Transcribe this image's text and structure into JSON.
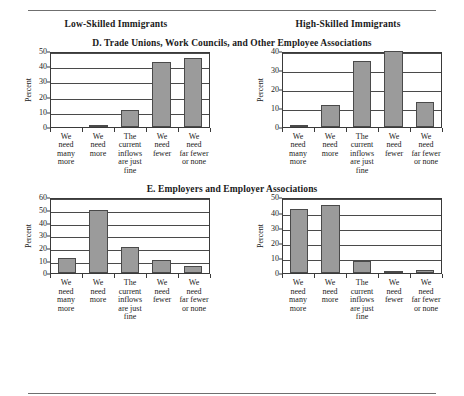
{
  "figure": {
    "column_headers": [
      "Low-Skilled Immigrants",
      "High-Skilled Immigrants"
    ],
    "panels": [
      {
        "title": "D. Trade Unions, Work Councils, and Other Employee Associations"
      },
      {
        "title": "E. Employers and Employer Associations"
      }
    ],
    "axis_label": "Percent"
  },
  "chart_data": [
    {
      "type": "bar",
      "title": "D. Trade Unions, Work Councils, and Other Employee Associations",
      "subtitle": "Low-Skilled Immigrants",
      "panel": "D",
      "column": "Low-Skilled Immigrants",
      "categories": [
        "We need many more",
        "We need more",
        "The current inflows are just fine",
        "We need fewer",
        "We need far fewer or none"
      ],
      "category_lines": [
        [
          "We",
          "need",
          "many",
          "more"
        ],
        [
          "We",
          "need",
          "more"
        ],
        [
          "The",
          "current",
          "inflows",
          "are just",
          "fine"
        ],
        [
          "We",
          "need",
          "fewer"
        ],
        [
          "We",
          "need",
          "far fewer",
          "or none"
        ]
      ],
      "values": [
        0,
        1.5,
        11,
        42.5,
        45.5
      ],
      "xlabel": "",
      "ylabel": "Percent",
      "ylim": [
        0,
        50
      ],
      "yticks": [
        0,
        10,
        20,
        30,
        40,
        50
      ],
      "grid": true,
      "legend": "none"
    },
    {
      "type": "bar",
      "title": "D. Trade Unions, Work Councils, and Other Employee Associations",
      "subtitle": "High-Skilled Immigrants",
      "panel": "D",
      "column": "High-Skilled Immigrants",
      "categories": [
        "We need many more",
        "We need more",
        "The current inflows are just fine",
        "We need fewer",
        "We need far fewer or none"
      ],
      "category_lines": [
        [
          "We",
          "need",
          "many",
          "more"
        ],
        [
          "We",
          "need",
          "more"
        ],
        [
          "The",
          "current",
          "inflows",
          "are just",
          "fine"
        ],
        [
          "We",
          "need",
          "fewer"
        ],
        [
          "We",
          "need",
          "far fewer",
          "or none"
        ]
      ],
      "values": [
        1,
        11.5,
        35,
        40,
        13
      ],
      "xlabel": "",
      "ylabel": "Percent",
      "ylim": [
        0,
        40
      ],
      "yticks": [
        0,
        10,
        20,
        30,
        40
      ],
      "grid": true,
      "legend": "none"
    },
    {
      "type": "bar",
      "title": "E. Employers and Employer Associations",
      "subtitle": "Low-Skilled Immigrants",
      "panel": "E",
      "column": "Low-Skilled Immigrants",
      "categories": [
        "We need many more",
        "We need more",
        "The current inflows are just fine",
        "We need fewer",
        "We need far fewer or none"
      ],
      "category_lines": [
        [
          "We",
          "need",
          "many",
          "more"
        ],
        [
          "We",
          "need",
          "more"
        ],
        [
          "The",
          "current",
          "inflows",
          "are just",
          "fine"
        ],
        [
          "We",
          "need",
          "fewer"
        ],
        [
          "We",
          "need",
          "far fewer",
          "or none"
        ]
      ],
      "values": [
        12.5,
        50,
        21,
        10.5,
        5.5
      ],
      "xlabel": "",
      "ylabel": "Percent",
      "ylim": [
        0,
        60
      ],
      "yticks": [
        0,
        10,
        20,
        30,
        40,
        50,
        60
      ],
      "grid": true,
      "legend": "none"
    },
    {
      "type": "bar",
      "title": "E. Employers and Employer Associations",
      "subtitle": "High-Skilled Immigrants",
      "panel": "E",
      "column": "High-Skilled Immigrants",
      "categories": [
        "We need many more",
        "We need more",
        "The current inflows are just fine",
        "We need fewer",
        "We need far fewer or none"
      ],
      "category_lines": [
        [
          "We",
          "need",
          "many",
          "more"
        ],
        [
          "We",
          "need",
          "more"
        ],
        [
          "The",
          "current",
          "inflows",
          "are just",
          "fine"
        ],
        [
          "We",
          "need",
          "fewer"
        ],
        [
          "We",
          "need",
          "far fewer",
          "or none"
        ]
      ],
      "values": [
        42.5,
        45,
        8,
        1.5,
        2.5
      ],
      "xlabel": "",
      "ylabel": "Percent",
      "ylim": [
        0,
        50
      ],
      "yticks": [
        0,
        10,
        20,
        30,
        40,
        50
      ],
      "grid": true,
      "legend": "none"
    }
  ],
  "style": {
    "bar_fill": "#9b9b9b",
    "bar_stroke": "#4a4a4a",
    "axis_color": "#3a3a3a",
    "grid_color": "#4a4a4a",
    "rule_color": "#6f6f6f",
    "text_color": "#1a1a1a"
  }
}
